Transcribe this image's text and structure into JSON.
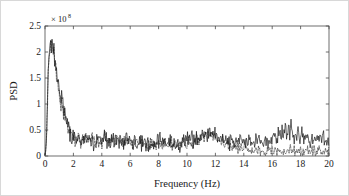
{
  "chart_data": {
    "type": "line",
    "title": "",
    "xlabel": "Frequency (Hz)",
    "ylabel": "PSD",
    "y_multiplier_text": "× 10",
    "y_multiplier_exponent": "8",
    "y_multiplier_value": 100000000,
    "xlim": [
      0,
      20
    ],
    "ylim": [
      0,
      2.5
    ],
    "xticks": [
      0,
      2,
      4,
      6,
      8,
      10,
      12,
      14,
      16,
      18,
      20
    ],
    "xticklabels": [
      "0",
      "2",
      "4",
      "6",
      "8",
      "10",
      "12",
      "14",
      "16",
      "18",
      "20"
    ],
    "yticks": [
      0,
      0.5,
      1,
      1.5,
      2,
      2.5
    ],
    "yticklabels": [
      "0",
      "0.5",
      "1",
      "1.5",
      "2",
      "2.5"
    ],
    "grid": false,
    "legend": "none",
    "box": true,
    "tick_direction": "in",
    "annotations": [
      {
        "label": "main low-frequency peak",
        "x": 0.4,
        "y": 2.2
      },
      {
        "label": "secondary peak",
        "x": 11.5,
        "y": 0.48
      },
      {
        "label": "secondary peak",
        "x": 17.3,
        "y": 0.55
      },
      {
        "label": "trace divergence onset",
        "x": 13.0,
        "y": 0.25
      }
    ],
    "series": [
      {
        "name": "solid-trace",
        "style": "solid",
        "color": "#101010",
        "x": [
          0.0,
          0.08,
          0.16,
          0.24,
          0.32,
          0.4,
          0.48,
          0.56,
          0.64,
          0.72,
          0.8,
          0.88,
          0.96,
          1.04,
          1.12,
          1.2,
          1.28,
          1.36,
          1.44,
          1.52,
          1.6,
          1.68,
          1.76,
          1.84,
          1.92,
          2.0,
          2.16,
          2.32,
          2.48,
          2.64,
          2.8,
          2.96,
          3.12,
          3.28,
          3.44,
          3.6,
          3.76,
          3.92,
          4.08,
          4.24,
          4.4,
          4.56,
          4.72,
          4.88,
          5.04,
          5.2,
          5.36,
          5.52,
          5.68,
          5.84,
          6.0,
          6.2,
          6.4,
          6.6,
          6.8,
          7.0,
          7.2,
          7.4,
          7.6,
          7.8,
          8.0,
          8.2,
          8.4,
          8.6,
          8.8,
          9.0,
          9.2,
          9.4,
          9.6,
          9.8,
          10.0,
          10.2,
          10.4,
          10.6,
          10.8,
          11.0,
          11.2,
          11.4,
          11.5,
          11.6,
          11.8,
          12.0,
          12.2,
          12.4,
          12.6,
          12.8,
          13.0,
          13.2,
          13.4,
          13.6,
          13.8,
          14.0,
          14.2,
          14.4,
          14.6,
          14.8,
          15.0,
          15.2,
          15.4,
          15.6,
          15.8,
          16.0,
          16.2,
          16.4,
          16.6,
          16.8,
          17.0,
          17.2,
          17.3,
          17.4,
          17.6,
          17.8,
          18.0,
          18.2,
          18.4,
          18.6,
          18.8,
          19.0,
          19.2,
          19.4,
          19.6,
          19.8,
          20.0
        ],
        "y": [
          0.02,
          0.18,
          0.95,
          1.72,
          2.05,
          2.21,
          2.12,
          2.18,
          1.98,
          1.86,
          1.62,
          1.48,
          1.36,
          1.18,
          1.05,
          1.12,
          0.95,
          0.86,
          0.74,
          0.66,
          0.58,
          0.52,
          0.47,
          0.43,
          0.4,
          0.38,
          0.36,
          0.35,
          0.34,
          0.33,
          0.36,
          0.32,
          0.31,
          0.33,
          0.3,
          0.29,
          0.31,
          0.28,
          0.3,
          0.34,
          0.31,
          0.29,
          0.32,
          0.3,
          0.33,
          0.35,
          0.31,
          0.29,
          0.28,
          0.3,
          0.27,
          0.26,
          0.28,
          0.25,
          0.24,
          0.26,
          0.24,
          0.23,
          0.25,
          0.24,
          0.26,
          0.28,
          0.25,
          0.24,
          0.27,
          0.25,
          0.23,
          0.26,
          0.28,
          0.3,
          0.29,
          0.31,
          0.3,
          0.33,
          0.34,
          0.36,
          0.4,
          0.44,
          0.48,
          0.44,
          0.4,
          0.37,
          0.35,
          0.33,
          0.31,
          0.3,
          0.29,
          0.28,
          0.3,
          0.27,
          0.26,
          0.28,
          0.26,
          0.25,
          0.27,
          0.26,
          0.28,
          0.3,
          0.29,
          0.31,
          0.3,
          0.32,
          0.34,
          0.37,
          0.4,
          0.44,
          0.49,
          0.53,
          0.55,
          0.52,
          0.46,
          0.42,
          0.38,
          0.36,
          0.34,
          0.32,
          0.31,
          0.3,
          0.29,
          0.28,
          0.29,
          0.27,
          0.28
        ]
      },
      {
        "name": "dashed-trace",
        "style": "dashed",
        "color": "#2b2b2b",
        "x": [
          0.0,
          0.08,
          0.16,
          0.24,
          0.32,
          0.4,
          0.48,
          0.56,
          0.64,
          0.72,
          0.8,
          0.88,
          0.96,
          1.04,
          1.12,
          1.2,
          1.28,
          1.36,
          1.44,
          1.52,
          1.6,
          1.68,
          1.76,
          1.84,
          1.92,
          2.0,
          2.16,
          2.32,
          2.48,
          2.64,
          2.8,
          2.96,
          3.12,
          3.28,
          3.44,
          3.6,
          3.76,
          3.92,
          4.08,
          4.24,
          4.4,
          4.56,
          4.72,
          4.88,
          5.04,
          5.2,
          5.36,
          5.52,
          5.68,
          5.84,
          6.0,
          6.2,
          6.4,
          6.6,
          6.8,
          7.0,
          7.2,
          7.4,
          7.6,
          7.8,
          8.0,
          8.2,
          8.4,
          8.6,
          8.8,
          9.0,
          9.2,
          9.4,
          9.6,
          9.8,
          10.0,
          10.2,
          10.4,
          10.6,
          10.8,
          11.0,
          11.2,
          11.4,
          11.5,
          11.6,
          11.8,
          12.0,
          12.2,
          12.4,
          12.6,
          12.8,
          13.0,
          13.2,
          13.4,
          13.6,
          13.8,
          14.0,
          14.2,
          14.4,
          14.6,
          14.8,
          15.0,
          15.2,
          15.4,
          15.6,
          15.8,
          16.0,
          16.2,
          16.4,
          16.6,
          16.8,
          17.0,
          17.2,
          17.4,
          17.6,
          17.8,
          18.0,
          18.2,
          18.4,
          18.6,
          18.8,
          19.0,
          19.2,
          19.4,
          19.6,
          19.8,
          20.0
        ],
        "y": [
          0.02,
          0.16,
          0.9,
          1.66,
          1.98,
          2.14,
          2.06,
          2.1,
          1.92,
          1.8,
          1.56,
          1.43,
          1.3,
          1.13,
          1.0,
          1.06,
          0.9,
          0.82,
          0.71,
          0.63,
          0.55,
          0.5,
          0.45,
          0.41,
          0.38,
          0.36,
          0.34,
          0.33,
          0.32,
          0.31,
          0.34,
          0.3,
          0.29,
          0.31,
          0.28,
          0.27,
          0.29,
          0.26,
          0.28,
          0.32,
          0.29,
          0.27,
          0.3,
          0.28,
          0.31,
          0.33,
          0.29,
          0.27,
          0.26,
          0.28,
          0.25,
          0.24,
          0.26,
          0.23,
          0.22,
          0.24,
          0.22,
          0.21,
          0.23,
          0.22,
          0.24,
          0.26,
          0.23,
          0.22,
          0.25,
          0.23,
          0.21,
          0.24,
          0.26,
          0.28,
          0.27,
          0.29,
          0.28,
          0.31,
          0.32,
          0.34,
          0.38,
          0.42,
          0.45,
          0.41,
          0.37,
          0.34,
          0.31,
          0.28,
          0.25,
          0.22,
          0.2,
          0.17,
          0.15,
          0.13,
          0.12,
          0.14,
          0.11,
          0.1,
          0.11,
          0.1,
          0.11,
          0.1,
          0.09,
          0.1,
          0.09,
          0.1,
          0.09,
          0.1,
          0.11,
          0.1,
          0.11,
          0.1,
          0.09,
          0.1,
          0.09,
          0.1,
          0.09,
          0.1,
          0.09,
          0.08,
          0.09,
          0.08,
          0.09,
          0.08,
          0.09,
          0.08
        ]
      }
    ]
  }
}
